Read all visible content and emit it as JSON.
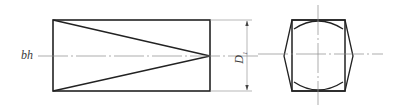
{
  "figure": {
    "type": "technical-drawing",
    "views": [
      "front-view",
      "end-view"
    ],
    "labels": {
      "axis_label": "bh",
      "dimension_label_main": "D",
      "dimension_label_sub": "1"
    },
    "colors": {
      "outline": "#222222",
      "centerline": "#8a8a8a",
      "dimension": "#9a9a9a",
      "text": "#3a3a3a"
    }
  }
}
